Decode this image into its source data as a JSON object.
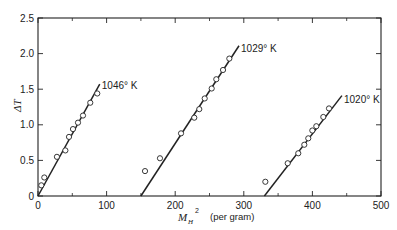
{
  "chart_data": {
    "type": "scatter",
    "title": "",
    "xlabel": "M_H^2",
    "xlabel_main": "M",
    "xlabel_sub": "H",
    "xlabel_sup": "2",
    "xlabel_unit": "(per gram)",
    "ylabel": "ΔT",
    "xlim": [
      0,
      500
    ],
    "ylim": [
      0,
      2.5
    ],
    "grid": false,
    "legend": "none (inline series labels)",
    "x_ticks": [
      0,
      100,
      200,
      300,
      400,
      500
    ],
    "x_tick_labels": [
      "0",
      "100",
      "200",
      "300",
      "400",
      "500"
    ],
    "x_minor_ticks": [
      50,
      150,
      250,
      350,
      450
    ],
    "y_ticks": [
      0,
      0.5,
      1.0,
      1.5,
      2.0,
      2.5
    ],
    "y_tick_labels": [
      "0",
      "0.5",
      "1.0",
      "1.5",
      "2.0",
      "2.5"
    ],
    "series": [
      {
        "name": "1046° K",
        "label": "1046° K",
        "points": [
          [
            4.8,
            0.15
          ],
          [
            9.2,
            0.26
          ],
          [
            27.6,
            0.55
          ],
          [
            39.9,
            0.64
          ],
          [
            45.2,
            0.83
          ],
          [
            51.0,
            0.94
          ],
          [
            58.3,
            1.03
          ],
          [
            65.6,
            1.13
          ],
          [
            76.2,
            1.31
          ],
          [
            86.4,
            1.44
          ]
        ],
        "fit_line": [
          [
            0,
            0
          ],
          [
            90,
            1.57
          ]
        ],
        "label_pos": [
          93,
          1.55
        ]
      },
      {
        "name": "1029° K",
        "label": "1029° K",
        "points": [
          [
            156.0,
            0.35
          ],
          [
            177.8,
            0.53
          ],
          [
            208.5,
            0.88
          ],
          [
            227.8,
            1.1
          ],
          [
            235.1,
            1.22
          ],
          [
            243.0,
            1.37
          ],
          [
            253.2,
            1.51
          ],
          [
            259.9,
            1.64
          ],
          [
            269.7,
            1.77
          ],
          [
            278.9,
            1.93
          ]
        ],
        "fit_line": [
          [
            150,
            0
          ],
          [
            293,
            2.11
          ]
        ],
        "label_pos": [
          296,
          2.07
        ]
      },
      {
        "name": "1020° K",
        "label": "1020° K",
        "points": [
          [
            331.4,
            0.2
          ],
          [
            364.0,
            0.46
          ],
          [
            379.4,
            0.6
          ],
          [
            388.2,
            0.72
          ],
          [
            394.0,
            0.81
          ],
          [
            399.9,
            0.92
          ],
          [
            405.7,
            0.98
          ],
          [
            415.9,
            1.11
          ],
          [
            424.2,
            1.23
          ]
        ],
        "fit_line": [
          [
            330,
            0
          ],
          [
            443,
            1.41
          ]
        ],
        "label_pos": [
          446,
          1.36
        ]
      }
    ]
  },
  "colors": {
    "ink": "#222222",
    "background": "#ffffff"
  }
}
